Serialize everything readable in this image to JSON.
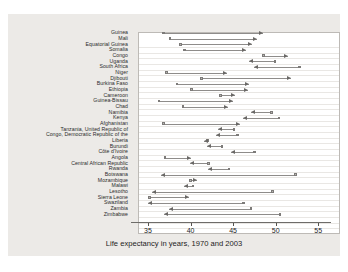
{
  "figure": {
    "xlabel": "Life expectancy in years, 1970 and 2003",
    "accent": "#8e8c8a",
    "panel_bg": "#eceae7",
    "plot_bg": "#ffffff"
  },
  "axis": {
    "ticks": [
      "35",
      "40",
      "45",
      "50",
      "55"
    ]
  },
  "chart_data": {
    "type": "bar",
    "title": "",
    "subtitle": "",
    "xlabel": "Life expectancy in years, 1970 and 2003",
    "ylabel": "",
    "xlim": [
      33,
      56.5
    ],
    "grid": true,
    "legend": "none",
    "note": "Dumbbell/arrow chart: open circle marks 1970 value, arrowhead marks 2003 value. Arrow points right for gains, left for losses.",
    "categories": [
      "Guinea",
      "Mali",
      "Equatorial Guinea",
      "Somalia",
      "Congo",
      "Uganda",
      "South Africa",
      "Niger",
      "Djibouti",
      "Burkina Faso",
      "Ethiopia",
      "Cameroon",
      "Guinea-Bissau",
      "Chad",
      "Namibia",
      "Kenya",
      "Afghanistan",
      "Tanzania, United Republic of",
      "Congo, Democratic Republic of the",
      "Liberia",
      "Burundi",
      "Côte d'Ivoire",
      "Angola",
      "Central African Republic",
      "Rwanda",
      "Botswana",
      "Mozambique",
      "Malawi",
      "Lesotho",
      "Sierra Leone",
      "Swaziland",
      "Zambia",
      "Zimbabwe"
    ],
    "series": [
      {
        "name": "1970",
        "values": [
          36.8,
          37.6,
          38.8,
          39.3,
          48.6,
          49.9,
          52.8,
          37.2,
          41.3,
          38.4,
          40.1,
          43.5,
          36.3,
          39.1,
          49.5,
          50.4,
          36.8,
          45.1,
          45.5,
          42.0,
          43.7,
          47.5,
          37.0,
          42.1,
          44.5,
          52.3,
          40.0,
          40.3,
          49.6,
          35.2,
          46.2,
          47.1,
          50.5
        ]
      },
      {
        "name": "2003",
        "values": [
          48.5,
          47.8,
          47.2,
          46.5,
          51.5,
          46.9,
          47.4,
          44.3,
          51.8,
          46.9,
          46.8,
          45.2,
          45.0,
          44.4,
          47.1,
          46.2,
          45.8,
          43.2,
          43.0,
          41.6,
          41.9,
          44.7,
          40.1,
          39.9,
          42.1,
          36.5,
          40.8,
          39.2,
          35.5,
          39.8,
          35.0,
          37.5,
          36.9
        ]
      }
    ]
  }
}
